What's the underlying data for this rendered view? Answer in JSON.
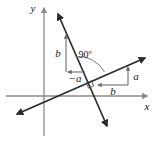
{
  "figure": {
    "background_color": "#ffffff",
    "axis_color": "#8c8c8c",
    "line_color": "#2b2b2b",
    "component_color": "#7a7a7a",
    "text_color": "#1a1a1a",
    "axes": {
      "x_label": "x",
      "y_label": "y",
      "origin_x": 44,
      "origin_y": 96
    },
    "labels": {
      "right_angle": "90º",
      "rise_left": "b",
      "run_left": "−a",
      "rise_right": "a",
      "run_right": "b"
    },
    "lines": [
      {
        "name": "shallow-line",
        "description": "line with positive slope a/b, double arrow",
        "x1": 15,
        "y1": 115,
        "x2": 147,
        "y2": 57
      },
      {
        "name": "steep-line",
        "description": "line with negative slope b/(-a), double arrow, perpendicular",
        "x1": 57,
        "y1": 12,
        "x2": 108,
        "y2": 128
      }
    ],
    "components": [
      {
        "name": "rise-left-arrow",
        "direction": "up",
        "label": "b",
        "x": 66,
        "y_from": 72,
        "y_to": 33
      },
      {
        "name": "run-left-arrow",
        "direction": "left",
        "label": "−a",
        "y": 72,
        "x_from": 86,
        "x_to": 66
      },
      {
        "name": "run-right-arrow",
        "direction": "left",
        "label": "b",
        "y": 85,
        "x_from": 128,
        "x_to": 96
      },
      {
        "name": "rise-right-arrow",
        "direction": "up",
        "label": "a",
        "x": 128,
        "y_from": 85,
        "y_to": 66
      }
    ]
  }
}
